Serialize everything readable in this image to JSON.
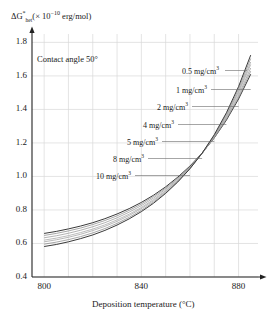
{
  "chart_data": {
    "type": "line",
    "title": "",
    "xlabel": "Deposition temperature (°C)",
    "ylabel": "ΔG*het (×10⁻¹⁰ erg/mol)",
    "ylabel_parts": {
      "delta_g": "ΔG",
      "star": "*",
      "sub": "het",
      "open": "(× 10",
      "exp": "−10",
      "tail": " erg/mol)"
    },
    "annotation": "Contact angle 50°",
    "xlim": [
      795,
      888
    ],
    "ylim": [
      0.4,
      1.85
    ],
    "xticks": [
      800,
      840,
      880
    ],
    "xtick_labels": [
      "800",
      "840",
      "880"
    ],
    "yticks": [
      0.4,
      0.6,
      0.8,
      1.0,
      1.2,
      1.4,
      1.6,
      1.8
    ],
    "ytick_labels": [
      "0.4",
      "0.6",
      "0.8",
      "1.0",
      "1.2",
      "1.4",
      "1.6",
      "1.8"
    ],
    "grid": true,
    "legend_position": "inline-leader-lines",
    "axis_arrows": true,
    "line_color": "#444444",
    "grid_color": "#d8d8d8",
    "axis_color": "#222222",
    "x": [
      800,
      805,
      810,
      815,
      820,
      825,
      830,
      835,
      840,
      845,
      850,
      855,
      860,
      865,
      870,
      875,
      880,
      885
    ],
    "series": [
      {
        "name": "0.5 mg/cm³",
        "label": "0.5 mg/cm",
        "exp": "3",
        "values": [
          0.66,
          0.672,
          0.687,
          0.704,
          0.724,
          0.748,
          0.776,
          0.808,
          0.845,
          0.888,
          0.938,
          0.996,
          1.062,
          1.14,
          1.23,
          1.336,
          1.462,
          1.61
        ]
      },
      {
        "name": "1 mg/cm³",
        "label": "1 mg/cm",
        "exp": "3",
        "values": [
          0.648,
          0.66,
          0.675,
          0.692,
          0.713,
          0.737,
          0.765,
          0.798,
          0.836,
          0.88,
          0.931,
          0.99,
          1.058,
          1.138,
          1.231,
          1.341,
          1.472,
          1.628
        ]
      },
      {
        "name": "2 mg/cm³",
        "label": "2 mg/cm",
        "exp": "3",
        "values": [
          0.634,
          0.646,
          0.661,
          0.679,
          0.7,
          0.724,
          0.753,
          0.787,
          0.826,
          0.871,
          0.924,
          0.985,
          1.055,
          1.137,
          1.234,
          1.348,
          1.484,
          1.647
        ]
      },
      {
        "name": "4 mg/cm³",
        "label": "4 mg/cm",
        "exp": "3",
        "values": [
          0.62,
          0.632,
          0.647,
          0.665,
          0.686,
          0.711,
          0.741,
          0.775,
          0.815,
          0.862,
          0.916,
          0.979,
          1.052,
          1.137,
          1.237,
          1.356,
          1.498,
          1.668
        ]
      },
      {
        "name": "5 mg/cm³",
        "label": "5 mg/cm",
        "exp": "3",
        "values": [
          0.61,
          0.622,
          0.637,
          0.655,
          0.677,
          0.702,
          0.732,
          0.767,
          0.808,
          0.855,
          0.911,
          0.975,
          1.05,
          1.137,
          1.24,
          1.362,
          1.508,
          1.683
        ]
      },
      {
        "name": "8 mg/cm³",
        "label": "8 mg/cm",
        "exp": "3",
        "values": [
          0.596,
          0.608,
          0.623,
          0.641,
          0.663,
          0.689,
          0.72,
          0.756,
          0.798,
          0.847,
          0.904,
          0.97,
          1.047,
          1.137,
          1.244,
          1.371,
          1.522,
          1.704
        ]
      },
      {
        "name": "10 mg/cm³",
        "label": "10 mg/cm",
        "exp": "3",
        "values": [
          0.582,
          0.594,
          0.61,
          0.629,
          0.651,
          0.678,
          0.71,
          0.747,
          0.79,
          0.84,
          0.899,
          0.967,
          1.046,
          1.139,
          1.249,
          1.38,
          1.536,
          1.724
        ]
      }
    ],
    "leader_labels": [
      {
        "text": "0.5 mg/cm",
        "exp": "3",
        "x": 182,
        "y": 65
      },
      {
        "text": "1 mg/cm",
        "exp": "3",
        "x": 176,
        "y": 84
      },
      {
        "text": "2 mg/cm",
        "exp": "3",
        "x": 157,
        "y": 101
      },
      {
        "text": "4 mg/cm",
        "exp": "3",
        "x": 143,
        "y": 119
      },
      {
        "text": "5 mg/cm",
        "exp": "3",
        "x": 127,
        "y": 136
      },
      {
        "text": "8 mg/cm",
        "exp": "3",
        "x": 113,
        "y": 153
      },
      {
        "text": "10 mg/cm",
        "exp": "3",
        "x": 96,
        "y": 170
      }
    ]
  }
}
